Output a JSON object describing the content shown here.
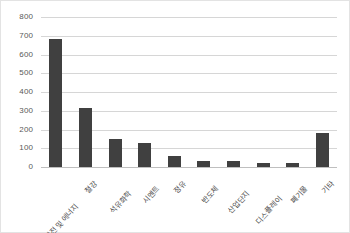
{
  "chart_data": {
    "type": "bar",
    "title": "",
    "subtitle": "",
    "xlabel": "",
    "ylabel": "",
    "ylim": [
      0,
      800
    ],
    "y_ticks": [
      800,
      700,
      600,
      500,
      400,
      300,
      200,
      100,
      0
    ],
    "grid": true,
    "legend": "none",
    "categories": [
      "발전 및 에너지",
      "철강",
      "석유화학",
      "시멘트",
      "정유",
      "반도체",
      "산업단지",
      "디스플레이",
      "폐기물",
      "기타"
    ],
    "values": [
      685,
      315,
      150,
      128,
      58,
      33,
      33,
      22,
      22,
      182
    ],
    "series": [
      {
        "name": "",
        "values": [
          685,
          315,
          150,
          128,
          58,
          33,
          33,
          22,
          22,
          182
        ]
      }
    ],
    "colors": {
      "bar": "#404040",
      "gridline": "#d6d6d6",
      "axis": "#bfbfbf",
      "tick_label": "#595959",
      "background": "#ffffff",
      "border": "#e3e3e3"
    }
  }
}
